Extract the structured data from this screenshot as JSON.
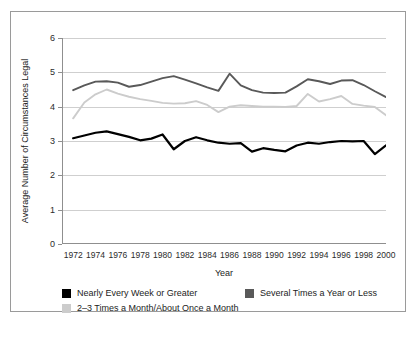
{
  "chart_data": {
    "type": "line",
    "title": "",
    "xlabel": "Year",
    "ylabel": "Average Number of Circumstances Legal",
    "xlim": [
      1971,
      2000
    ],
    "ylim": [
      0,
      6
    ],
    "yticks": [
      0,
      1,
      2,
      3,
      4,
      5,
      6
    ],
    "xticks": [
      1972,
      1974,
      1976,
      1978,
      1980,
      1982,
      1984,
      1986,
      1988,
      1990,
      1992,
      1994,
      1996,
      1998,
      2000
    ],
    "grid": "horizontal",
    "legend_position": "below",
    "x": [
      1972,
      1973,
      1974,
      1975,
      1976,
      1977,
      1978,
      1979,
      1980,
      1981,
      1982,
      1983,
      1984,
      1985,
      1986,
      1987,
      1988,
      1989,
      1990,
      1991,
      1992,
      1993,
      1994,
      1995,
      1996,
      1997,
      1998,
      1999,
      2000
    ],
    "series": [
      {
        "name": "Nearly Every Week or Greater",
        "color": "#000000",
        "values": [
          3.08,
          3.16,
          3.24,
          3.28,
          3.2,
          3.12,
          3.02,
          3.07,
          3.19,
          2.76,
          3.0,
          3.11,
          3.02,
          2.95,
          2.92,
          2.94,
          2.69,
          2.79,
          2.74,
          2.7,
          2.87,
          2.95,
          2.92,
          2.97,
          3.0,
          2.99,
          3.0,
          2.62,
          2.87
        ]
      },
      {
        "name": "Several Times a Year or Less",
        "color": "#595959",
        "values": [
          4.48,
          4.62,
          4.73,
          4.74,
          4.7,
          4.58,
          4.63,
          4.73,
          4.83,
          4.89,
          4.79,
          4.68,
          4.56,
          4.46,
          4.96,
          4.62,
          4.48,
          4.41,
          4.4,
          4.41,
          4.59,
          4.8,
          4.74,
          4.66,
          4.76,
          4.77,
          4.63,
          4.45,
          4.28
        ]
      },
      {
        "name": "2–3 Times a Month/About Once a Month",
        "color": "#cccccc",
        "values": [
          3.66,
          4.12,
          4.36,
          4.5,
          4.38,
          4.29,
          4.22,
          4.17,
          4.11,
          4.09,
          4.1,
          4.16,
          4.05,
          3.84,
          4.0,
          4.04,
          4.02,
          4.0,
          4.0,
          3.99,
          4.02,
          4.37,
          4.15,
          4.22,
          4.31,
          4.08,
          4.03,
          3.99,
          3.75
        ]
      }
    ]
  },
  "legend": {
    "items": [
      {
        "label": "Nearly Every Week or Greater",
        "color": "#000000"
      },
      {
        "label": "Several Times a Year or Less",
        "color": "#595959"
      },
      {
        "label": "2–3 Times a Month/About Once a Month",
        "color": "#cccccc"
      }
    ]
  }
}
